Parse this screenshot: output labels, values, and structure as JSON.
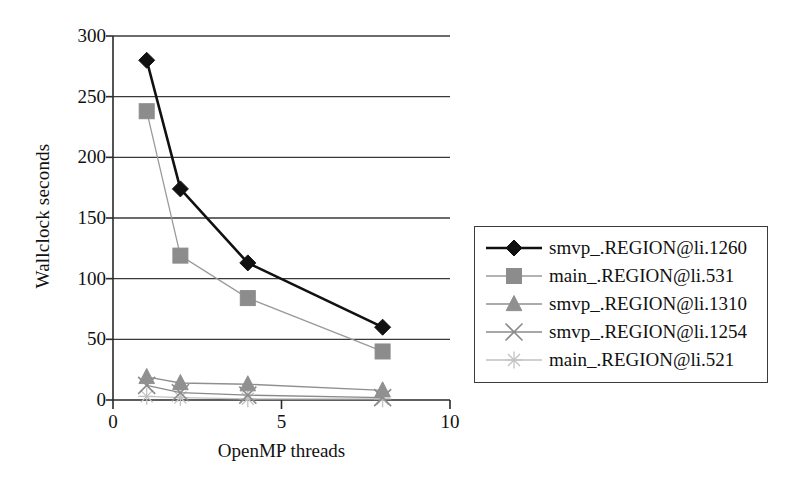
{
  "chart_data": {
    "type": "line",
    "title": "",
    "xlabel": "OpenMP threads",
    "ylabel": "Wallclock seconds",
    "xlim": [
      0,
      10
    ],
    "ylim": [
      0,
      300
    ],
    "xticks": [
      "0",
      "5",
      "10"
    ],
    "xtick_values": [
      0,
      5,
      10
    ],
    "yticks": [
      "0",
      "50",
      "100",
      "150",
      "200",
      "250",
      "300"
    ],
    "ytick_values": [
      0,
      50,
      100,
      150,
      200,
      250,
      300
    ],
    "grid": "horizontal",
    "legend_position": "right",
    "x": [
      1,
      2,
      4,
      8
    ],
    "series": [
      {
        "name": "smvp_.REGION@li.1260",
        "marker": "diamond",
        "color": "#111111",
        "line_color": "#111111",
        "values": [
          280,
          174,
          113,
          60
        ]
      },
      {
        "name": "main_.REGION@li.531",
        "marker": "square",
        "color": "#8c8c8c",
        "line_color": "#9a9a9a",
        "values": [
          238,
          119,
          84,
          40
        ]
      },
      {
        "name": "smvp_.REGION@li.1310",
        "marker": "triangle",
        "color": "#909090",
        "line_color": "#8f8f8f",
        "values": [
          19,
          14,
          13,
          8
        ]
      },
      {
        "name": "smvp_.REGION@li.1254",
        "marker": "cross",
        "color": "#8a8a8a",
        "line_color": "#8a8a8a",
        "values": [
          12,
          6,
          4,
          2
        ]
      },
      {
        "name": "main_.REGION@li.521",
        "marker": "asterisk",
        "color": "#c2c2c2",
        "line_color": "#c2c2c2",
        "values": [
          3,
          2,
          1,
          1
        ]
      }
    ]
  },
  "axes": {
    "plot_left_px": 113,
    "plot_right_px": 450,
    "plot_top_px": 36,
    "plot_bottom_px": 400
  }
}
